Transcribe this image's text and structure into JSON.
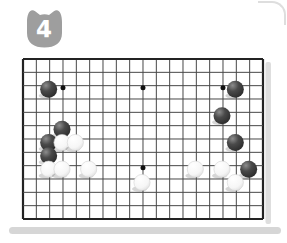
{
  "badge": {
    "number": "4"
  },
  "board": {
    "cols": 19,
    "rows": 13,
    "star_points": [
      [
        3,
        2
      ],
      [
        9,
        2
      ],
      [
        15,
        2
      ],
      [
        9,
        8
      ]
    ],
    "stones": [
      {
        "color": "black",
        "col": 2,
        "row": 2
      },
      {
        "color": "black",
        "col": 16,
        "row": 2
      },
      {
        "color": "black",
        "col": 15,
        "row": 4
      },
      {
        "color": "black",
        "col": 3,
        "row": 5
      },
      {
        "color": "black",
        "col": 2,
        "row": 6
      },
      {
        "color": "white",
        "col": 3,
        "row": 6
      },
      {
        "color": "white",
        "col": 4,
        "row": 6
      },
      {
        "color": "black",
        "col": 16,
        "row": 6
      },
      {
        "color": "black",
        "col": 2,
        "row": 7
      },
      {
        "color": "white",
        "col": 2,
        "row": 8
      },
      {
        "color": "white",
        "col": 3,
        "row": 8
      },
      {
        "color": "white",
        "col": 5,
        "row": 8
      },
      {
        "color": "white",
        "col": 13,
        "row": 8
      },
      {
        "color": "white",
        "col": 15,
        "row": 8
      },
      {
        "color": "black",
        "col": 17,
        "row": 8
      },
      {
        "color": "white",
        "col": 9,
        "row": 9
      },
      {
        "color": "white",
        "col": 16,
        "row": 9
      }
    ],
    "colors": {
      "line": "#474747",
      "border": "#232323",
      "star": "#111111",
      "black_stone_dark": "#262626",
      "black_stone_light": "#8d8d8d",
      "white_stone_edge": "#d4d4d4",
      "board_edge_shadow": "#dedede",
      "page_shadow": "#d6d6d6",
      "badge": "#9e9e9e"
    }
  }
}
